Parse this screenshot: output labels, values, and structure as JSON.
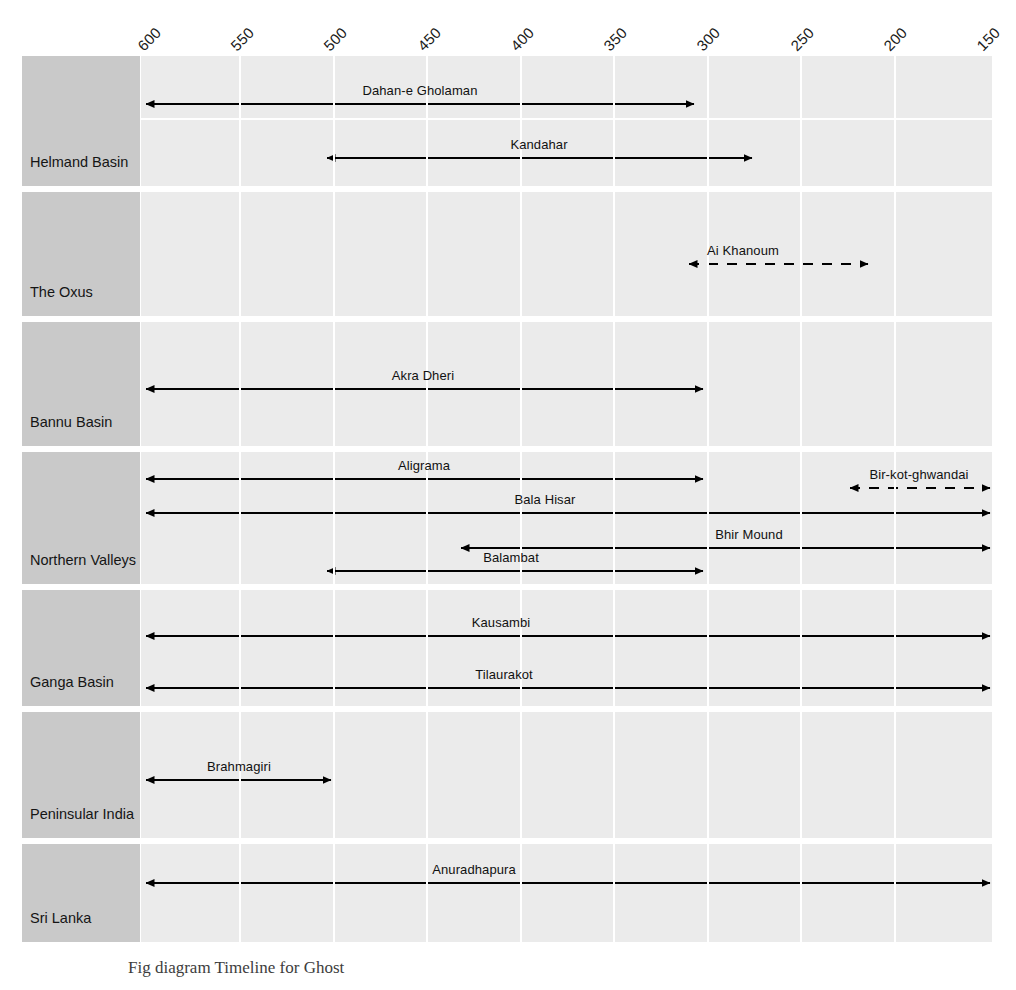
{
  "chart_data": {
    "type": "bar",
    "subtype": "gantt-timeline",
    "xlabel": "",
    "ylabel": "",
    "x_unit": "BCE",
    "xlim": [
      600,
      150
    ],
    "x_direction": "decreasing",
    "grid": true,
    "legend": "none",
    "axis_ticks": [
      600,
      550,
      500,
      450,
      400,
      350,
      300,
      250,
      200,
      150
    ],
    "tick_labels": [
      "600",
      "550",
      "500",
      "450",
      "400",
      "350",
      "300",
      "250",
      "200",
      "150"
    ],
    "categories": [
      "Helmand Basin",
      "The Oxus",
      "Bannu Basin",
      "Northern Valleys",
      "Ganga Basin",
      "Peninsular India",
      "Sri Lanka"
    ],
    "series": [
      {
        "region": "Helmand Basin",
        "bars": [
          {
            "name": "Dahan-e Gholaman",
            "start": 600,
            "end": 310,
            "style": "solid",
            "arrows": "both"
          },
          {
            "name": "Kandahar",
            "start": 502,
            "end": 275,
            "style": "solid",
            "arrows": "both"
          }
        ]
      },
      {
        "region": "The Oxus",
        "bars": [
          {
            "name": "Ai Khanoum",
            "start": 330,
            "end": 215,
            "style": "dashed",
            "arrows": "both"
          }
        ]
      },
      {
        "region": "Bannu Basin",
        "bars": [
          {
            "name": "Akra Dheri",
            "start": 600,
            "end": 305,
            "style": "solid",
            "arrows": "both"
          }
        ]
      },
      {
        "region": "Northern Valleys",
        "bars": [
          {
            "name": "Aligrama",
            "start": 600,
            "end": 305,
            "style": "solid",
            "arrows": "both"
          },
          {
            "name": "Bir-kot-ghwandai",
            "start": 235,
            "end": 150,
            "style": "dashed",
            "arrows": "both"
          },
          {
            "name": "Bala Hisar",
            "start": 600,
            "end": 150,
            "style": "solid",
            "arrows": "both"
          },
          {
            "name": "Bhir Mound",
            "start": 432,
            "end": 150,
            "style": "solid",
            "arrows": "both"
          },
          {
            "name": "Balambat",
            "start": 500,
            "end": 305,
            "style": "solid",
            "arrows": "both"
          }
        ]
      },
      {
        "region": "Ganga Basin",
        "bars": [
          {
            "name": "Kausambi",
            "start": 600,
            "end": 150,
            "style": "solid",
            "arrows": "both"
          },
          {
            "name": "Tilaurakot",
            "start": 600,
            "end": 150,
            "style": "solid",
            "arrows": "both"
          }
        ]
      },
      {
        "region": "Peninsular India",
        "bars": [
          {
            "name": "Brahmagiri",
            "start": 600,
            "end": 500,
            "style": "solid",
            "arrows": "both"
          }
        ]
      },
      {
        "region": "Sri Lanka",
        "bars": [
          {
            "name": "Anuradhapura",
            "start": 600,
            "end": 150,
            "style": "solid",
            "arrows": "both"
          }
        ]
      }
    ]
  },
  "rows": [
    {
      "label": "Helmand Basin",
      "top": 0,
      "height": 130,
      "split_at": 62
    },
    {
      "label": "The Oxus",
      "top": 136,
      "height": 124,
      "split_at": null
    },
    {
      "label": "Bannu Basin",
      "top": 266,
      "height": 124,
      "split_at": null
    },
    {
      "label": "Northern Valleys",
      "top": 396,
      "height": 132,
      "split_at": null
    },
    {
      "label": "Ganga Basin",
      "top": 534,
      "height": 116,
      "split_at": null
    },
    {
      "label": "Peninsular India",
      "top": 656,
      "height": 126,
      "split_at": null
    },
    {
      "label": "Sri Lanka",
      "top": 788,
      "height": 98,
      "split_at": null
    }
  ],
  "bars_positioned": [
    {
      "name": "Dahan-e Gholaman",
      "y": 48,
      "x1": 5,
      "x2": 553,
      "dashed": false,
      "label_x": 279
    },
    {
      "name": "Kandahar",
      "y": 102,
      "x1": 186,
      "x2": 611,
      "dashed": false,
      "label_x": 398
    },
    {
      "name": "Ai Khanoum",
      "y": 208,
      "x1": 548,
      "x2": 727,
      "dashed": true,
      "label_x": 602
    },
    {
      "name": "Akra Dheri",
      "y": 333,
      "x1": 5,
      "x2": 562,
      "dashed": false,
      "label_x": 282
    },
    {
      "name": "Aligrama",
      "y": 423,
      "x1": 5,
      "x2": 562,
      "dashed": false,
      "label_x": 283
    },
    {
      "name": "Bir-kot-ghwandai",
      "y": 432,
      "x1": 709,
      "x2": 849,
      "dashed": true,
      "label_x": 778
    },
    {
      "name": "Bala Hisar",
      "y": 457,
      "x1": 5,
      "x2": 849,
      "dashed": false,
      "label_x": 404
    },
    {
      "name": "Bhir Mound",
      "y": 492,
      "x1": 320,
      "x2": 849,
      "dashed": false,
      "label_x": 608
    },
    {
      "name": "Balambat",
      "y": 515,
      "x1": 186,
      "x2": 562,
      "dashed": false,
      "label_x": 370
    },
    {
      "name": "Kausambi",
      "y": 580,
      "x1": 5,
      "x2": 849,
      "dashed": false,
      "label_x": 360
    },
    {
      "name": "Tilaurakot",
      "y": 632,
      "x1": 5,
      "x2": 849,
      "dashed": false,
      "label_x": 363
    },
    {
      "name": "Brahmagiri",
      "y": 724,
      "x1": 5,
      "x2": 190,
      "dashed": false,
      "label_x": 98
    },
    {
      "name": "Anuradhapura",
      "y": 827,
      "x1": 5,
      "x2": 849,
      "dashed": false,
      "label_x": 333
    }
  ],
  "caption": {
    "text": "Fig diagram    Timeline for Ghost"
  },
  "colors": {
    "band": "#ebebeb",
    "label_box": "#c9c9c9",
    "grid": "#ffffff",
    "arrow": "#000000",
    "text": "#151515",
    "page": "#ffffff"
  }
}
